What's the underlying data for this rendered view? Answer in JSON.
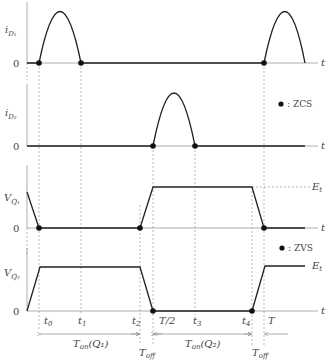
{
  "diagram": {
    "title": "",
    "time_axis_label": "t",
    "zero_label": "0",
    "plots": [
      {
        "id": "iD1",
        "ylabel_main": "i",
        "ylabel_sub": "D₁",
        "description": "Sine half-wave current pulses of diode D1 starting at t0 and ending at t1, repeating after T"
      },
      {
        "id": "iD2",
        "ylabel_main": "i",
        "ylabel_sub": "D₂",
        "description": "Sine half-wave current pulse of diode D2 from T/2 to t3"
      },
      {
        "id": "VQ1",
        "ylabel_main": "V",
        "ylabel_sub": "Q₁",
        "level_label": "E",
        "level_sub": "t",
        "description": "Trapezoidal voltage across Q1: falls to 0 at t0, rises during Toff to Et at T/2, falls at t4"
      },
      {
        "id": "VQ2",
        "ylabel_main": "V",
        "ylabel_sub": "Q₂",
        "level_label": "E",
        "level_sub": "t",
        "description": "Trapezoidal voltage across Q2: rises to Et at t0, falls to 0 at T/2, rises again at T"
      }
    ],
    "legends": [
      {
        "symbol": "●",
        "text": ": ZCS"
      },
      {
        "symbol": "●",
        "text": ": ZVS"
      }
    ],
    "time_ticks": [
      {
        "main": "t",
        "sub": "0"
      },
      {
        "main": "t",
        "sub": "1"
      },
      {
        "main": "t",
        "sub": "2"
      },
      {
        "main": "T/2",
        "sub": ""
      },
      {
        "main": "t",
        "sub": "3"
      },
      {
        "main": "t",
        "sub": "4"
      },
      {
        "main": "T",
        "sub": ""
      }
    ],
    "intervals": [
      {
        "main": "T",
        "sub": "on",
        "arg": "(Q₁)"
      },
      {
        "main": "T",
        "sub": "off",
        "arg": ""
      },
      {
        "main": "T",
        "sub": "on",
        "arg": "(Q₂)"
      },
      {
        "main": "T",
        "sub": "off",
        "arg": ""
      }
    ]
  }
}
